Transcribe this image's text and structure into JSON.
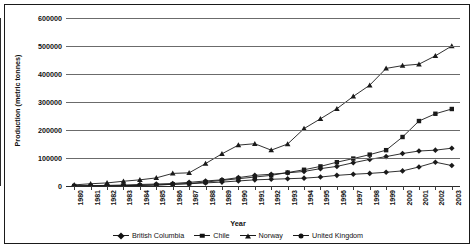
{
  "chart_data": {
    "type": "line",
    "title": "",
    "xlabel": "Year",
    "ylabel": "Production (metric tonnes)",
    "ylim": [
      0,
      600000
    ],
    "ytick_step": 100000,
    "yticks": [
      "600000",
      "500000",
      "400000",
      "300000",
      "200000",
      "100000",
      "0"
    ],
    "grid": true,
    "legend_position": "bottom",
    "categories": [
      "1980",
      "1981",
      "1982",
      "1983",
      "1984",
      "1985",
      "1986",
      "1987",
      "1988",
      "1989",
      "1990",
      "1991",
      "1992",
      "1993",
      "1994",
      "1995",
      "1996",
      "1997",
      "1998",
      "1999",
      "2000",
      "2001",
      "2002",
      "2003"
    ],
    "series": [
      {
        "name": "British Columbia",
        "marker": "diamond",
        "values": [
          100,
          200,
          500,
          1200,
          2500,
          4000,
          6000,
          8000,
          11000,
          14000,
          18000,
          22000,
          24000,
          26000,
          28000,
          32000,
          38000,
          42000,
          45000,
          49000,
          54000,
          68000,
          85000,
          73000
        ]
      },
      {
        "name": "Chile",
        "marker": "square",
        "values": [
          100,
          200,
          400,
          1000,
          2000,
          3500,
          6000,
          9000,
          14000,
          20000,
          26000,
          32000,
          38000,
          48000,
          58000,
          70000,
          85000,
          98000,
          112000,
          128000,
          175000,
          232000,
          258000,
          275000
        ]
      },
      {
        "name": "Norway",
        "marker": "triangle",
        "values": [
          4000,
          8000,
          11000,
          17000,
          22000,
          29000,
          45000,
          47000,
          80000,
          115000,
          146000,
          151000,
          128000,
          150000,
          205000,
          240000,
          276000,
          320000,
          360000,
          420000,
          430000,
          435000,
          465000,
          500000
        ]
      },
      {
        "name": "United Kingdom",
        "marker": "diamond-filled",
        "values": [
          600,
          1100,
          2200,
          3500,
          5500,
          7000,
          9000,
          13000,
          18000,
          22000,
          30000,
          38000,
          42000,
          47000,
          52000,
          62000,
          70000,
          83000,
          95000,
          105000,
          116000,
          125000,
          128000,
          135000
        ]
      }
    ]
  },
  "legend": {
    "items": [
      {
        "label": "British Columbia",
        "marker": "diamond-icon"
      },
      {
        "label": "Chile",
        "marker": "square-icon"
      },
      {
        "label": "Norway",
        "marker": "triangle-icon"
      },
      {
        "label": "United Kingdom",
        "marker": "circle-icon"
      }
    ]
  },
  "colors": {
    "series_line": "#1a1a1a",
    "gridline": "#6b6b6b",
    "axis": "#2b2b2b",
    "text": "#111111",
    "background": "#ffffff"
  }
}
